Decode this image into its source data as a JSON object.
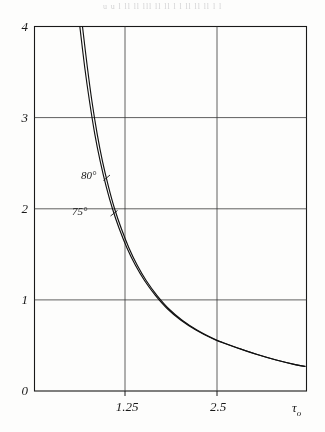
{
  "page": {
    "background_color": "#fdfdfc",
    "ink_color": "#1d1d1d",
    "top_cut_text": "u u  l ll ll  lll    ll ll l    l ll ll ll     l l"
  },
  "chart_data": {
    "type": "line",
    "title": "",
    "subtitle": "",
    "xlabel": "τ₀",
    "ylabel": "",
    "xlim": [
      0.0,
      3.6
    ],
    "ylim": [
      0,
      4
    ],
    "grid": true,
    "grid_style": "solid-thin",
    "legend_position": "inline-annotation",
    "x_ticks": [
      {
        "value": 1.25,
        "label": "1.25"
      },
      {
        "value": 2.5,
        "label": "2.5"
      }
    ],
    "x_origin_label": "0",
    "y_ticks": [
      {
        "value": 4,
        "label": "4"
      },
      {
        "value": 3,
        "label": "3"
      },
      {
        "value": 2,
        "label": "2"
      },
      {
        "value": 1,
        "label": "1"
      },
      {
        "value": 0,
        "label": "0"
      }
    ],
    "annotations": [
      {
        "text": "80°",
        "x": 1.05,
        "y": 1.72,
        "series": "80°"
      },
      {
        "text": "75°",
        "x": 0.82,
        "y": 1.3,
        "series": "75°"
      }
    ],
    "series": [
      {
        "name": "80°",
        "label": "80°",
        "color": "#151515",
        "points": [
          {
            "x": 0.635,
            "y": 4.0
          },
          {
            "x": 0.7,
            "y": 3.55
          },
          {
            "x": 0.76,
            "y": 3.18
          },
          {
            "x": 0.83,
            "y": 2.82
          },
          {
            "x": 0.9,
            "y": 2.52
          },
          {
            "x": 0.98,
            "y": 2.24
          },
          {
            "x": 1.06,
            "y": 2.0
          },
          {
            "x": 1.15,
            "y": 1.78
          },
          {
            "x": 1.25,
            "y": 1.57
          },
          {
            "x": 1.36,
            "y": 1.38
          },
          {
            "x": 1.48,
            "y": 1.21
          },
          {
            "x": 1.62,
            "y": 1.05
          },
          {
            "x": 1.78,
            "y": 0.9
          },
          {
            "x": 1.95,
            "y": 0.78
          },
          {
            "x": 2.15,
            "y": 0.67
          },
          {
            "x": 2.38,
            "y": 0.57
          },
          {
            "x": 2.5,
            "y": 0.53
          },
          {
            "x": 2.7,
            "y": 0.47
          },
          {
            "x": 2.95,
            "y": 0.4
          },
          {
            "x": 3.2,
            "y": 0.34
          },
          {
            "x": 3.45,
            "y": 0.29
          },
          {
            "x": 3.58,
            "y": 0.27
          }
        ]
      },
      {
        "name": "75°",
        "label": "75°",
        "color": "#151515",
        "points": [
          {
            "x": 0.6,
            "y": 4.0
          },
          {
            "x": 0.665,
            "y": 3.55
          },
          {
            "x": 0.728,
            "y": 3.18
          },
          {
            "x": 0.798,
            "y": 2.82
          },
          {
            "x": 0.87,
            "y": 2.52
          },
          {
            "x": 0.95,
            "y": 2.24
          },
          {
            "x": 1.032,
            "y": 2.0
          },
          {
            "x": 1.122,
            "y": 1.78
          },
          {
            "x": 1.224,
            "y": 1.57
          },
          {
            "x": 1.336,
            "y": 1.38
          },
          {
            "x": 1.458,
            "y": 1.21
          },
          {
            "x": 1.6,
            "y": 1.05
          },
          {
            "x": 1.762,
            "y": 0.9
          },
          {
            "x": 1.934,
            "y": 0.78
          },
          {
            "x": 2.136,
            "y": 0.67
          },
          {
            "x": 2.368,
            "y": 0.57
          },
          {
            "x": 2.492,
            "y": 0.53
          },
          {
            "x": 2.694,
            "y": 0.47
          },
          {
            "x": 2.946,
            "y": 0.4
          },
          {
            "x": 3.198,
            "y": 0.34
          },
          {
            "x": 3.45,
            "y": 0.29
          },
          {
            "x": 3.58,
            "y": 0.27
          }
        ]
      }
    ]
  }
}
